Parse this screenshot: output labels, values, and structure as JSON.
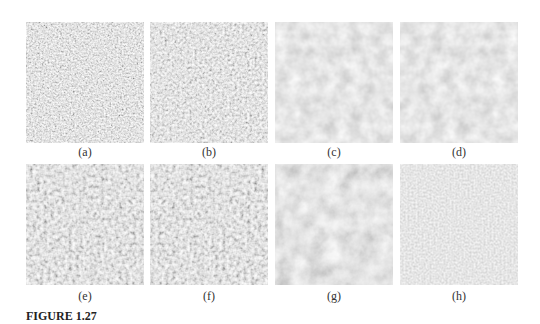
{
  "figure": {
    "label": "FIGURE 1.27",
    "panels": [
      {
        "caption": "(a)",
        "texture": "fine-noise",
        "base_color": "#8e8e8e",
        "contrast": "high"
      },
      {
        "caption": "(b)",
        "texture": "fine-noise",
        "base_color": "#8f8f8f",
        "contrast": "high"
      },
      {
        "caption": "(c)",
        "texture": "smooth-noise",
        "base_color": "#959595",
        "contrast": "low"
      },
      {
        "caption": "(d)",
        "texture": "smooth-noise",
        "base_color": "#969696",
        "contrast": "low"
      },
      {
        "caption": "(e)",
        "texture": "coarse-noise",
        "base_color": "#8c8c8c",
        "contrast": "high"
      },
      {
        "caption": "(f)",
        "texture": "coarse-noise",
        "base_color": "#8f8f8f",
        "contrast": "high"
      },
      {
        "caption": "(g)",
        "texture": "blotchy-noise",
        "base_color": "#939393",
        "contrast": "medium"
      },
      {
        "caption": "(h)",
        "texture": "smooth-noise",
        "base_color": "#999999",
        "contrast": "very-low"
      }
    ]
  }
}
